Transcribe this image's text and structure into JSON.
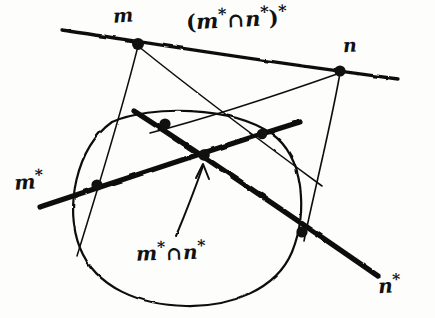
{
  "figure": {
    "medium": "hand-drawn ink sketch",
    "background_color": "#fdfdfb",
    "ink_color": "#111111",
    "width": 435,
    "height": 318,
    "labels": {
      "point_m": "m",
      "point_n": "n",
      "line_m_star_base": "m",
      "line_m_star_sup": "*",
      "line_n_star_base": "n",
      "line_n_star_sup": "*",
      "intersection_open_paren": "(",
      "intersection_m_base": "m",
      "intersection_m_sup": "*",
      "intersection_cap": "∩",
      "intersection_n_base": "n",
      "intersection_n_sup": "*",
      "intersection_close_paren": ")",
      "intersection_outer_sup": "*",
      "center_m_base": "m",
      "center_m_sup": "*",
      "center_cap": "∩",
      "center_n_base": "n",
      "center_n_sup": "*"
    }
  },
  "geometry": {
    "conic": {
      "type": "circle",
      "cx": 188,
      "cy": 208,
      "rx": 113,
      "ry": 98
    },
    "thick_lines": [
      {
        "name": "m-star-polar",
        "from": [
          40,
          206
        ],
        "to": [
          300,
          122
        ],
        "width": 5.4
      },
      {
        "name": "n-star-polar",
        "from": [
          134,
          110
        ],
        "to": [
          378,
          275
        ],
        "width": 5.4
      },
      {
        "name": "line-mn",
        "from": [
          62,
          29
        ],
        "to": [
          398,
          78
        ],
        "width": 3.4
      }
    ],
    "thin_lines": [
      {
        "name": "tangent-m-left",
        "from": [
          138,
          44
        ],
        "to": [
          77,
          256
        ]
      },
      {
        "name": "tangent-m-right",
        "from": [
          138,
          44
        ],
        "to": [
          322,
          185
        ]
      },
      {
        "name": "tangent-n-left",
        "from": [
          340,
          71
        ],
        "to": [
          150,
          133
        ]
      },
      {
        "name": "tangent-n-right",
        "from": [
          340,
          71
        ],
        "to": [
          304,
          240
        ]
      }
    ],
    "dots": [
      {
        "name": "point-m",
        "cx": 138,
        "cy": 44,
        "r": 6.0
      },
      {
        "name": "point-n",
        "cx": 340,
        "cy": 71,
        "r": 5.6
      },
      {
        "name": "contact-upper-left",
        "cx": 165,
        "cy": 124,
        "r": 5.6
      },
      {
        "name": "contact-upper-right",
        "cx": 262,
        "cy": 134,
        "r": 5.2
      },
      {
        "name": "pole-center",
        "cx": 204,
        "cy": 155,
        "r": 5.8
      },
      {
        "name": "contact-lower-left",
        "cx": 97,
        "cy": 185,
        "r": 5.6
      },
      {
        "name": "contact-lower-right",
        "cx": 302,
        "cy": 232,
        "r": 5.6
      }
    ],
    "arrow": {
      "name": "pointer-to-center",
      "from": [
        176,
        235
      ],
      "to": [
        202,
        165
      ],
      "head_size": 11
    }
  }
}
